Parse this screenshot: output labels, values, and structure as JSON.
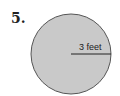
{
  "problem": {
    "number": "5.",
    "shape": "circle",
    "radius_label": "3 feet"
  },
  "colors": {
    "fill": "#c9c9c9",
    "stroke": "#555555",
    "text": "#222222"
  }
}
